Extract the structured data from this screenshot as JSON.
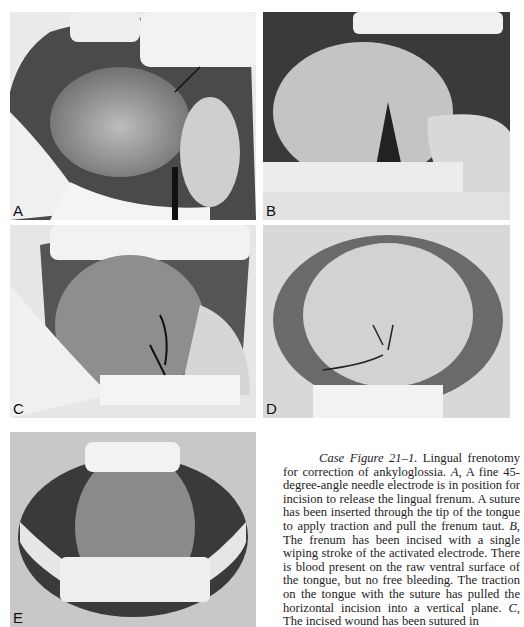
{
  "figure": {
    "panels": [
      {
        "label": "A",
        "description": "Open mouth, tongue raised with suture through tip; needle electrode positioned at lingual frenum"
      },
      {
        "label": "B",
        "description": "Frenum incised; blood on ventral tongue surface; retractor at right"
      },
      {
        "label": "C",
        "description": "Incised wound sutured"
      },
      {
        "label": "D",
        "description": "Healing sutured wound on ventral tongue"
      },
      {
        "label": "E",
        "description": "Healed result, tongue elevated"
      }
    ],
    "caption": {
      "title": "Case Figure 21–1.",
      "lines": [
        "Lingual frenotomy for correction of ankyloglossia. ",
        "A,",
        " A fine 45-degree-angle needle electrode is in position for incision to release the lingual frenum. A suture has been inserted through the tip of the tongue to apply traction and pull the frenum taut. ",
        "B,",
        " The frenum has been incised with a single wiping stroke of the activated electrode. There is blood present on the raw ventral surface of the tongue, but no free bleeding. The traction on the tongue with the suture has pulled the horizontal incision into a vertical plane. ",
        "C,",
        " The incised wound has been sutured in"
      ]
    }
  }
}
